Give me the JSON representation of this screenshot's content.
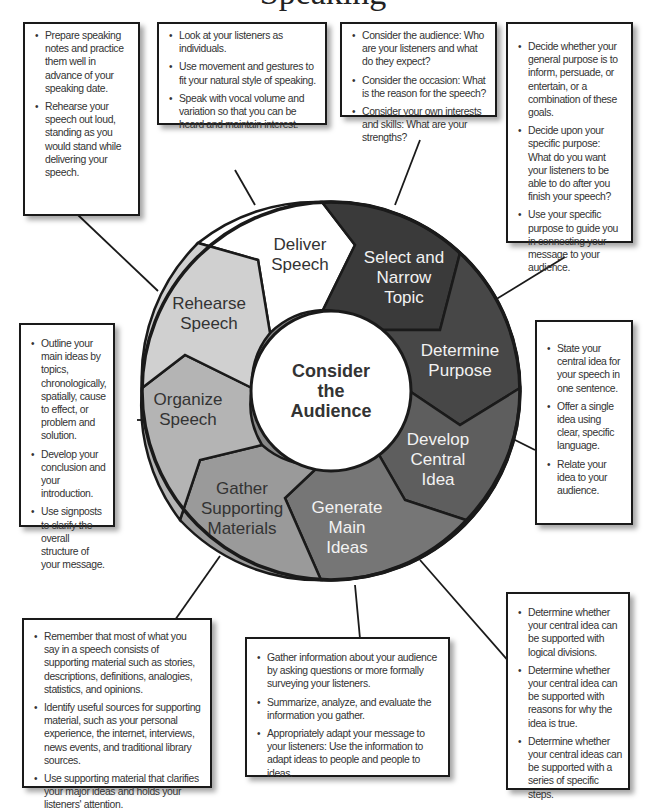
{
  "title": "Speaking",
  "center": {
    "label_lines": [
      "Consider",
      "the",
      "Audience"
    ]
  },
  "steps": [
    {
      "id": "select-topic",
      "lines": [
        "Select and",
        "Narrow",
        "Topic"
      ],
      "fill": "#3a3a3a",
      "text_color": "#f2f2f2"
    },
    {
      "id": "determine-purpose",
      "lines": [
        "Determine",
        "Purpose"
      ],
      "fill": "#474747",
      "text_color": "#f2f2f2"
    },
    {
      "id": "develop-central-idea",
      "lines": [
        "Develop",
        "Central",
        "Idea"
      ],
      "fill": "#5e5e5e",
      "text_color": "#f2f2f2"
    },
    {
      "id": "generate-main-ideas",
      "lines": [
        "Generate",
        "Main",
        "Ideas"
      ],
      "fill": "#767676",
      "text_color": "#f2f2f2"
    },
    {
      "id": "gather-supporting-materials",
      "lines": [
        "Gather",
        "Supporting",
        "Materials"
      ],
      "fill": "#9a9a9a",
      "text_color": "#333333"
    },
    {
      "id": "organize-speech",
      "lines": [
        "Organize",
        "Speech"
      ],
      "fill": "#b4b4b4",
      "text_color": "#333333"
    },
    {
      "id": "rehearse-speech",
      "lines": [
        "Rehearse",
        "Speech"
      ],
      "fill": "#d0d0d0",
      "text_color": "#333333"
    },
    {
      "id": "deliver-speech",
      "lines": [
        "Deliver",
        "Speech"
      ],
      "fill": "#ffffff",
      "text_color": "#333333"
    }
  ],
  "boxes": {
    "rehearse": {
      "items": [
        "Prepare speaking notes and practice them well in advance of your speaking date.",
        "Rehearse your speech out loud, standing as you would stand while delivering your speech."
      ]
    },
    "deliver": {
      "items": [
        "Look at your listeners as individuals.",
        "Use movement and gestures to fit your natural style of speaking.",
        "Speak with vocal volume and variation so that you can be heard and maintain interest."
      ]
    },
    "select_topic": {
      "items": [
        "Consider the audience: Who are your listeners and what do they expect?",
        "Consider the occasion: What is the reason for the speech?",
        "Consider your own interests and skills: What are your strengths?"
      ]
    },
    "determine_purpose": {
      "items": [
        "Decide whether your general purpose is to inform, persuade, or entertain, or a combination of these goals.",
        "Decide upon your specific purpose: What do you want your listeners to be able to do after you finish your speech?",
        "Use your specific purpose to guide you in connecting your message to your audience."
      ]
    },
    "organize": {
      "items": [
        "Outline your main ideas by topics, chronologically, spatially, cause to effect, or problem and solution.",
        "Develop your conclusion and your introduction.",
        "Use signposts to clarify the overall structure of your message."
      ]
    },
    "central_idea": {
      "items": [
        "State your central idea for your speech in one sentence.",
        "Offer a single idea using clear, specific language.",
        "Relate your idea to your audience."
      ]
    },
    "supporting": {
      "items": [
        "Remember that most of what you say in a speech consists of supporting material such as stories, descriptions, definitions, analogies, statistics, and opinions.",
        "Identify useful sources for supporting material, such as your personal experience, the internet, interviews, news events, and traditional library sources.",
        "Use supporting material that clarifies your major ideas and holds your listeners' attention."
      ]
    },
    "audience": {
      "items": [
        "Gather information about your audience by asking questions or more formally surveying your listeners.",
        "Summarize, analyze, and evaluate the information you gather.",
        "Appropriately adapt your message to your listeners: Use the information to adapt ideas to people and people to ideas."
      ]
    },
    "main_ideas": {
      "items": [
        "Determine whether your central idea can be supported with logical divisions.",
        "Determine whether your central idea can be supported with reasons for why the idea is true.",
        "Determine whether your central ideas can be supported with a series of specific steps."
      ]
    }
  }
}
